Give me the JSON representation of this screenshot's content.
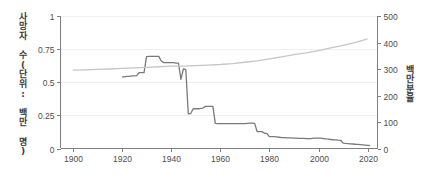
{
  "chart_data": {
    "type": "line",
    "title": "",
    "subtitle": "",
    "xlabel": "",
    "ylabel": "사망자 수(단위: 백만 명)",
    "y2label": "백만분율",
    "xlim": [
      1895,
      2024
    ],
    "ylim": [
      0,
      1
    ],
    "y2lim": [
      0,
      500
    ],
    "grid": true,
    "legend_position": "none",
    "xticks": [
      1900,
      1920,
      1940,
      1960,
      1980,
      2000,
      2020
    ],
    "xticklabels": [
      "1900",
      "1920",
      "1940",
      "1960",
      "1980",
      "2000",
      "2020"
    ],
    "yticks": [
      0,
      0.25,
      0.5,
      0.75,
      1
    ],
    "yticklabels": [
      "0",
      "0.25",
      "0.5",
      "0.75",
      "1"
    ],
    "y2ticks": [
      0,
      100,
      200,
      300,
      400,
      500
    ],
    "y2ticklabels": [
      "0",
      "100",
      "200",
      "300",
      "400",
      "500"
    ],
    "series": [
      {
        "name": "사망자 수",
        "axis": "left",
        "color": "#7a7a7a",
        "width": 1.3,
        "x": [
          1920,
          1921,
          1922,
          1923,
          1924,
          1925,
          1926,
          1927,
          1928,
          1929,
          1930,
          1931,
          1932,
          1933,
          1934,
          1935,
          1936,
          1937,
          1938,
          1939,
          1940,
          1941,
          1942,
          1943,
          1944,
          1945,
          1946,
          1947,
          1948,
          1949,
          1950,
          1951,
          1952,
          1953,
          1954,
          1955,
          1956,
          1957,
          1958,
          1959,
          1960,
          1961,
          1962,
          1963,
          1964,
          1965,
          1966,
          1967,
          1968,
          1969,
          1970,
          1971,
          1972,
          1973,
          1974,
          1975,
          1976,
          1977,
          1978,
          1979,
          1980,
          1981,
          1982,
          1983,
          1984,
          1985,
          1986,
          1987,
          1988,
          1989,
          1990,
          1991,
          1992,
          1993,
          1994,
          1995,
          1996,
          1997,
          1998,
          1999,
          2000,
          2001,
          2002,
          2003,
          2004,
          2005,
          2006,
          2007,
          2008,
          2009,
          2010,
          2011,
          2012,
          2013,
          2014,
          2015,
          2016,
          2017,
          2018,
          2019,
          2020,
          2021
        ],
        "y": [
          0.54,
          0.54,
          0.545,
          0.545,
          0.548,
          0.548,
          0.55,
          0.572,
          0.572,
          0.572,
          0.693,
          0.695,
          0.695,
          0.695,
          0.695,
          0.695,
          0.66,
          0.648,
          0.648,
          0.648,
          0.648,
          0.648,
          0.645,
          0.645,
          0.522,
          0.6,
          0.595,
          0.262,
          0.264,
          0.3,
          0.3,
          0.3,
          0.302,
          0.305,
          0.318,
          0.318,
          0.318,
          0.318,
          0.19,
          0.188,
          0.188,
          0.188,
          0.188,
          0.188,
          0.188,
          0.188,
          0.188,
          0.188,
          0.188,
          0.188,
          0.188,
          0.19,
          0.192,
          0.192,
          0.19,
          0.128,
          0.127,
          0.127,
          0.115,
          0.112,
          0.09,
          0.09,
          0.09,
          0.088,
          0.085,
          0.082,
          0.082,
          0.08,
          0.08,
          0.08,
          0.078,
          0.078,
          0.077,
          0.077,
          0.076,
          0.075,
          0.074,
          0.075,
          0.078,
          0.079,
          0.079,
          0.078,
          0.075,
          0.072,
          0.07,
          0.068,
          0.066,
          0.065,
          0.063,
          0.062,
          0.04,
          0.038,
          0.037,
          0.035,
          0.034,
          0.032,
          0.031,
          0.03,
          0.028,
          0.026,
          0.024,
          0.022
        ]
      },
      {
        "name": "백만분율",
        "axis": "right",
        "color": "#c6c6c6",
        "width": 1.3,
        "x": [
          1900,
          1905,
          1910,
          1915,
          1920,
          1925,
          1930,
          1935,
          1940,
          1945,
          1950,
          1955,
          1960,
          1965,
          1970,
          1975,
          1980,
          1985,
          1990,
          1995,
          2000,
          2005,
          2010,
          2015,
          2020
        ],
        "y": [
          295.5,
          297.0,
          298.5,
          300.0,
          302.0,
          304.0,
          306.5,
          308.5,
          310.5,
          311.0,
          312.5,
          315.0,
          317.0,
          320.5,
          325.5,
          331.0,
          338.5,
          346.0,
          354.0,
          361.0,
          369.5,
          379.5,
          389.5,
          400.5,
          414.0
        ]
      }
    ]
  }
}
